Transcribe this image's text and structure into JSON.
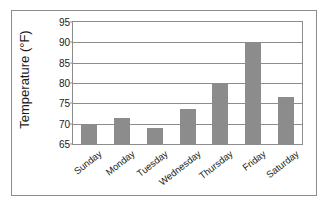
{
  "chart_data": {
    "type": "bar",
    "title": "",
    "subtitle": "",
    "xlabel": "",
    "ylabel": "Temperature (°F)",
    "categories": [
      "Sunday",
      "Monday",
      "Tuesday",
      "Wednesday",
      "Thursday",
      "Friday",
      "Saturday"
    ],
    "values": [
      70,
      71.5,
      69,
      73.5,
      80,
      90,
      76.5
    ],
    "series": [
      {
        "name": "Temperature",
        "values": [
          70,
          71.5,
          69,
          73.5,
          80,
          90,
          76.5
        ]
      }
    ],
    "ylim": [
      65,
      95
    ],
    "yticks": [
      65,
      70,
      75,
      80,
      85,
      90,
      95
    ],
    "ytick_labels": [
      "65",
      "70",
      "75",
      "80",
      "85",
      "90",
      "95"
    ],
    "grid": true,
    "grid_axis": "y",
    "legend": false,
    "legend_position": "none",
    "bar_color": "#8c8c8c",
    "grid_color": "#8d8d8d",
    "frame_color": "#8d8d8d",
    "background_color": "#ffffff",
    "text_color": "#1a1a1a",
    "xtick_rotation": -38
  }
}
